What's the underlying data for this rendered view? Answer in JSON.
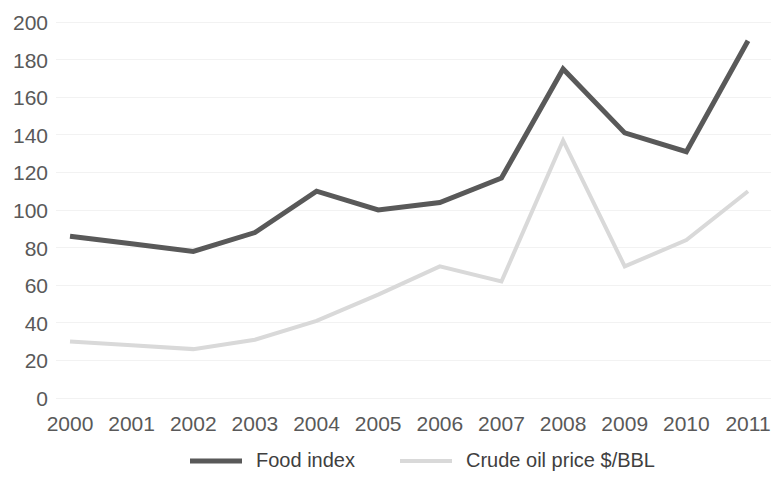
{
  "chart_data": {
    "type": "line",
    "title": "",
    "xlabel": "",
    "ylabel": "",
    "categories": [
      "2000",
      "2001",
      "2002",
      "2003",
      "2004",
      "2005",
      "2006",
      "2007",
      "2008",
      "2009",
      "2010",
      "2011"
    ],
    "ylim": [
      0,
      200
    ],
    "ytick_step": 20,
    "yticks": [
      "0",
      "20",
      "40",
      "60",
      "80",
      "100",
      "120",
      "140",
      "160",
      "180",
      "200"
    ],
    "grid": "horizontal-light",
    "legend_position": "bottom-center",
    "series": [
      {
        "name": "Food index",
        "color": "#595959",
        "line_width": 5,
        "values": [
          86,
          82,
          78,
          88,
          110,
          100,
          104,
          117,
          175,
          141,
          131,
          190
        ]
      },
      {
        "name": "Crude oil price $/BBL",
        "color": "#d9d9d9",
        "line_width": 4,
        "values": [
          30,
          28,
          26,
          31,
          41,
          55,
          70,
          62,
          137,
          70,
          84,
          110
        ]
      }
    ]
  },
  "legend": {
    "items": [
      {
        "label": "Food index",
        "color": "#595959"
      },
      {
        "label": "Crude oil price $/BBL",
        "color": "#d9d9d9"
      }
    ]
  }
}
